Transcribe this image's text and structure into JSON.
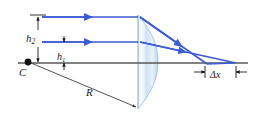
{
  "figure": {
    "kind": "optics-ray-diagram",
    "labels": {
      "h2": "h",
      "h2_sub": "2",
      "h1": "h",
      "h1_sub": "1",
      "center": "C",
      "radius": "R",
      "delta_x_symbol": "Δ",
      "delta_x_var": "x"
    },
    "colors": {
      "ray": "#3b5bd4",
      "axis": "#595959",
      "dimension": "#1a1a1a",
      "lens_fill_light": "#eaf2fb",
      "lens_fill_mid": "#bcd8ef",
      "lens_edge": "#7fa8cf",
      "background": "#ffffff"
    },
    "geometry": {
      "axis_y": 63,
      "axis_x_start": 18,
      "axis_x_end": 248,
      "center_point": [
        28,
        62
      ],
      "lens_flat_x": 138,
      "lens_apex_x": 157,
      "lens_top_y": 15,
      "lens_bottom_y": 109,
      "ray_top_y": 17,
      "ray_mid_y": 42,
      "ray_start_x": 42,
      "focus_outer_x": 205,
      "focus_inner_x": 233,
      "h2_value_px": 46,
      "h1_value_px": 21
    }
  }
}
